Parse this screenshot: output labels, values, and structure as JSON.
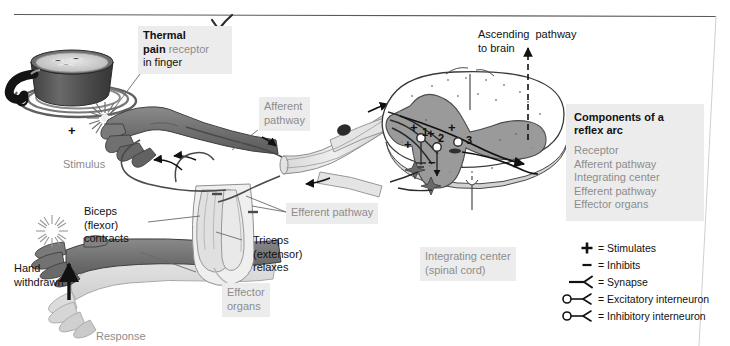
{
  "figure": {
    "title_hidden": "Withdrawal reflex arc",
    "top_rule": true,
    "page_edge_line": true
  },
  "labels": {
    "thermal_receptor": {
      "bold": "Thermal\npain",
      "rest": " receptor\nin finger"
    },
    "thermal_receptor_line1_bold": "Thermal",
    "thermal_receptor_line2_bold": "pain",
    "thermal_receptor_line2_rest": " receptor",
    "thermal_receptor_line3": "in finger",
    "stimulus": "Stimulus",
    "afferent_pathway": "Afferent\npathway",
    "efferent_pathway": "Efferent pathway",
    "ascending_pathway": "Ascending  pathway\nto brain",
    "integrating_center": "Integrating center\n(spinal cord)",
    "biceps": "Biceps\n(flexor)\ncontracts",
    "triceps": "Triceps\n(extensor)\nrelaxes",
    "hand_withdrawn": "Hand\nwithdrawn",
    "effector_organs": "Effector\norgans",
    "response": "Response",
    "plus_stimulus_marker": "+"
  },
  "spinal_markers": [
    {
      "sign": "+",
      "number": "1"
    },
    {
      "sign": "+",
      "number": "2"
    },
    {
      "sign": "+",
      "number": "3"
    },
    {
      "sign": "+",
      "number": ""
    },
    {
      "sign": "−",
      "number": ""
    }
  ],
  "components_box": {
    "title": "Components of a\nreflex arc",
    "title_line1": "Components of a",
    "title_line2": "reflex arc",
    "items": [
      "Receptor",
      "Afferent pathway",
      "Integrating center",
      "Efferent pathway",
      "Effector organs"
    ]
  },
  "legend": {
    "entries": [
      {
        "symbol": "plus",
        "text": "= Stimulates"
      },
      {
        "symbol": "minus",
        "text": "= Inhibits"
      },
      {
        "symbol": "synapse",
        "text": "= Synapse"
      },
      {
        "symbol": "excitatory-interneuron",
        "text": "= Excitatory interneuron"
      },
      {
        "symbol": "inhibitory-interneuron",
        "text": "= Inhibitory interneuron"
      }
    ]
  },
  "colors": {
    "chip_bg": "#ececec",
    "chip_text": "#8c8c8c",
    "ink": "#111111",
    "arm_dark": "#6e6e6e",
    "arm_light": "#d9d9d9",
    "grey_matter": "#9a9a9a",
    "white_matter": "#ffffff",
    "pot_dark": "#4a4a4a",
    "muscle": "#e6e6e6"
  }
}
